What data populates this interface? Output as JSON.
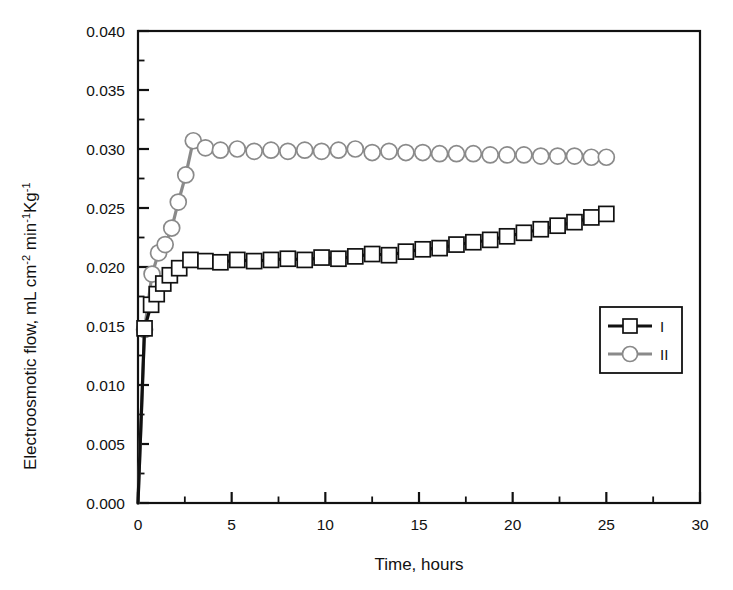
{
  "chart_data": {
    "type": "line",
    "title": "",
    "xlabel": "Time, hours",
    "ylabel": "Electroosmotic flow, mL cm-2 min-1Kg-1",
    "ylabel_parts": {
      "base1": "Electroosmotic flow, mL cm",
      "sup1": "-2",
      "base2": " min",
      "sup2": "-1",
      "base3": "Kg",
      "sup3": "-1"
    },
    "xlim": [
      0,
      30
    ],
    "ylim": [
      0,
      0.04
    ],
    "xticks": [
      0,
      5,
      10,
      15,
      20,
      25,
      30
    ],
    "xtick_labels": [
      "0",
      "5",
      "10",
      "15",
      "20",
      "25",
      "30"
    ],
    "yticks": [
      0.0,
      0.005,
      0.01,
      0.015,
      0.02,
      0.025,
      0.03,
      0.035,
      0.04
    ],
    "ytick_labels": [
      "0.000",
      "0.005",
      "0.010",
      "0.015",
      "0.020",
      "0.025",
      "0.030",
      "0.035",
      "0.040"
    ],
    "x_minor_tick_step": 2.5,
    "y_minor_tick_step": 0.0025,
    "grid": false,
    "legend_position": "right-middle",
    "series": [
      {
        "name": "I",
        "marker": "square",
        "color": "#111111",
        "line_color": "#111111",
        "marker_fill": "#ffffff",
        "points": [
          {
            "x": 0.0,
            "y": 0.0
          },
          {
            "x": 0.35,
            "y": 0.0148
          },
          {
            "x": 0.7,
            "y": 0.0168
          },
          {
            "x": 1.0,
            "y": 0.0177
          },
          {
            "x": 1.35,
            "y": 0.0186
          },
          {
            "x": 1.7,
            "y": 0.0193
          },
          {
            "x": 2.2,
            "y": 0.0199
          },
          {
            "x": 2.8,
            "y": 0.0206
          },
          {
            "x": 3.6,
            "y": 0.0205
          },
          {
            "x": 4.4,
            "y": 0.0204
          },
          {
            "x": 5.3,
            "y": 0.0206
          },
          {
            "x": 6.2,
            "y": 0.0205
          },
          {
            "x": 7.1,
            "y": 0.0206
          },
          {
            "x": 8.0,
            "y": 0.0207
          },
          {
            "x": 8.9,
            "y": 0.0206
          },
          {
            "x": 9.8,
            "y": 0.0208
          },
          {
            "x": 10.7,
            "y": 0.0207
          },
          {
            "x": 11.6,
            "y": 0.0209
          },
          {
            "x": 12.5,
            "y": 0.0211
          },
          {
            "x": 13.4,
            "y": 0.021
          },
          {
            "x": 14.3,
            "y": 0.0213
          },
          {
            "x": 15.2,
            "y": 0.0215
          },
          {
            "x": 16.1,
            "y": 0.0216
          },
          {
            "x": 17.0,
            "y": 0.0219
          },
          {
            "x": 17.9,
            "y": 0.0221
          },
          {
            "x": 18.8,
            "y": 0.0223
          },
          {
            "x": 19.7,
            "y": 0.0226
          },
          {
            "x": 20.6,
            "y": 0.0229
          },
          {
            "x": 21.5,
            "y": 0.0232
          },
          {
            "x": 22.4,
            "y": 0.0235
          },
          {
            "x": 23.3,
            "y": 0.0238
          },
          {
            "x": 24.2,
            "y": 0.0242
          },
          {
            "x": 25.0,
            "y": 0.0245
          }
        ]
      },
      {
        "name": "II",
        "marker": "circle",
        "color": "#8a8a8a",
        "line_color": "#8a8a8a",
        "marker_fill": "#ffffff",
        "points": [
          {
            "x": 0.0,
            "y": 0.0
          },
          {
            "x": 0.35,
            "y": 0.0147
          },
          {
            "x": 0.75,
            "y": 0.0194
          },
          {
            "x": 1.1,
            "y": 0.0212
          },
          {
            "x": 1.45,
            "y": 0.0219
          },
          {
            "x": 1.8,
            "y": 0.0233
          },
          {
            "x": 2.15,
            "y": 0.0255
          },
          {
            "x": 2.55,
            "y": 0.0278
          },
          {
            "x": 2.95,
            "y": 0.0307
          },
          {
            "x": 3.6,
            "y": 0.0301
          },
          {
            "x": 4.4,
            "y": 0.0299
          },
          {
            "x": 5.3,
            "y": 0.03
          },
          {
            "x": 6.2,
            "y": 0.0298
          },
          {
            "x": 7.1,
            "y": 0.0299
          },
          {
            "x": 8.0,
            "y": 0.0298
          },
          {
            "x": 8.9,
            "y": 0.0299
          },
          {
            "x": 9.8,
            "y": 0.0298
          },
          {
            "x": 10.7,
            "y": 0.0299
          },
          {
            "x": 11.6,
            "y": 0.03
          },
          {
            "x": 12.5,
            "y": 0.0297
          },
          {
            "x": 13.4,
            "y": 0.0298
          },
          {
            "x": 14.3,
            "y": 0.0297
          },
          {
            "x": 15.2,
            "y": 0.0297
          },
          {
            "x": 16.1,
            "y": 0.0296
          },
          {
            "x": 17.0,
            "y": 0.0296
          },
          {
            "x": 17.9,
            "y": 0.0296
          },
          {
            "x": 18.8,
            "y": 0.0295
          },
          {
            "x": 19.7,
            "y": 0.0295
          },
          {
            "x": 20.6,
            "y": 0.0295
          },
          {
            "x": 21.5,
            "y": 0.0294
          },
          {
            "x": 22.4,
            "y": 0.0294
          },
          {
            "x": 23.3,
            "y": 0.0294
          },
          {
            "x": 24.2,
            "y": 0.0293
          },
          {
            "x": 25.0,
            "y": 0.0293
          }
        ]
      }
    ],
    "legend": [
      {
        "label": "I",
        "marker": "square",
        "color": "#111111"
      },
      {
        "label": "II",
        "marker": "circle",
        "color": "#8a8a8a"
      }
    ]
  },
  "colors": {
    "series_i": "#111111",
    "series_ii": "#8a8a8a",
    "axis": "#111111",
    "background": "#ffffff"
  }
}
